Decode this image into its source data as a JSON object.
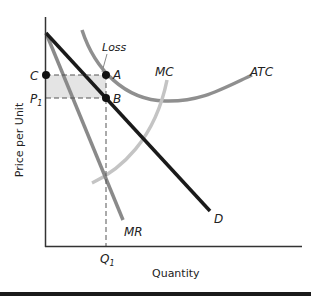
{
  "diagram": {
    "type": "monopoly-loss-graph",
    "axes": {
      "x_label": "Quantity",
      "y_label": "Price per Unit"
    },
    "curves": [
      {
        "name": "D",
        "label": "D",
        "color": "#1a1a1a"
      },
      {
        "name": "MR",
        "label": "MR",
        "color": "#8a8a8a"
      },
      {
        "name": "MC",
        "label": "MC",
        "color": "#bdbdbd"
      },
      {
        "name": "ATC",
        "label": "ATC",
        "color": "#8f8f8f"
      }
    ],
    "points": {
      "A": "A",
      "B": "B",
      "C": "C"
    },
    "ticks": {
      "x": "Q",
      "x_sub": "1",
      "y_price": "P",
      "y_price_sub": "1",
      "y_cost": "C"
    },
    "annotation": "Loss",
    "loss_area_color": "#e3e3e3"
  }
}
